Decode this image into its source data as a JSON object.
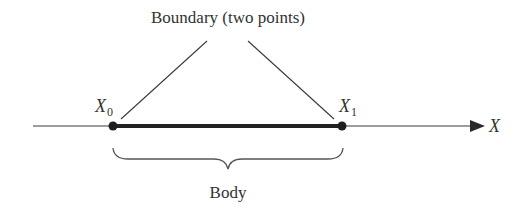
{
  "diagram": {
    "title": "Boundary (two points)",
    "axis": {
      "label": "X",
      "color": "#2a2a2a"
    },
    "points": [
      {
        "symbol": "X",
        "subscript": "0"
      },
      {
        "symbol": "X",
        "subscript": "1"
      }
    ],
    "body_label": "Body",
    "colors": {
      "line": "#2a2a2a",
      "text": "#333333",
      "background": "#ffffff"
    }
  }
}
